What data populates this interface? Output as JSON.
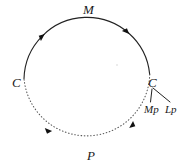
{
  "figure": {
    "type": "cycle-diagram",
    "background_color": "#ffffff",
    "stroke_color": "#222222",
    "width": 190,
    "height": 166
  },
  "cycle": {
    "center_x": 87,
    "center_y": 81,
    "radius": 63,
    "direction": "clockwise",
    "solid_arc": {
      "name": "M",
      "style": "solid",
      "start_angle_deg": 182,
      "end_angle_deg": 366
    },
    "dotted_arc": {
      "name": "P",
      "style": "dotted",
      "start_angle_deg": 6,
      "end_angle_deg": 182
    },
    "arrowheads": [
      {
        "name": "arrow-top-left",
        "angle_deg": 228
      },
      {
        "name": "arrow-top-right",
        "angle_deg": 312
      },
      {
        "name": "arrow-bottom-right",
        "angle_deg": 48
      },
      {
        "name": "arrow-bottom-left",
        "angle_deg": 132
      }
    ]
  },
  "labels": {
    "top": "M",
    "bottom": "P",
    "left": "C",
    "right": "C",
    "branch_left": "Mp",
    "branch_right": "Lp"
  },
  "branch": {
    "origin_x": 152,
    "origin_y": 88,
    "left_end_x": 150,
    "left_end_y": 102,
    "right_end_x": 171,
    "right_end_y": 102
  }
}
